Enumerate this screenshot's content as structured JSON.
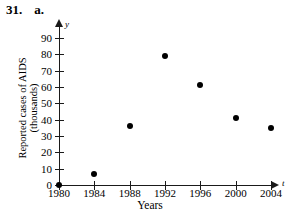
{
  "header": {
    "number": "31.",
    "part": "a."
  },
  "chart_data": {
    "type": "scatter",
    "title": "",
    "xlabel": "Years",
    "ylabel_lines": [
      "Reported cases of AIDS",
      "(thousands)"
    ],
    "ylabel": "Reported cases of AIDS (thousands)",
    "x_axis_variable": "t",
    "y_axis_variable": "y",
    "grid": false,
    "legend": "none",
    "xlim": [
      1980,
      2004
    ],
    "ylim": [
      0,
      90
    ],
    "x_ticks": [
      1980,
      1984,
      1988,
      1992,
      1996,
      2000,
      2004
    ],
    "x_tick_labels": [
      "1980",
      "1984",
      "1988",
      "1992",
      "1996",
      "2000",
      "2004"
    ],
    "y_ticks": [
      0,
      10,
      20,
      30,
      40,
      50,
      60,
      70,
      80,
      90
    ],
    "y_tick_labels": [
      "0",
      "10",
      "20",
      "30",
      "40",
      "50",
      "60",
      "70",
      "80",
      "90"
    ],
    "x": [
      1980,
      1984,
      1988,
      1992,
      1996,
      2000,
      2004
    ],
    "values": [
      0,
      7,
      36,
      79,
      61,
      41,
      35
    ],
    "points": [
      {
        "x": 1980,
        "y": 0
      },
      {
        "x": 1984,
        "y": 7
      },
      {
        "x": 1988,
        "y": 36
      },
      {
        "x": 1992,
        "y": 79
      },
      {
        "x": 1996,
        "y": 61
      },
      {
        "x": 2000,
        "y": 41
      },
      {
        "x": 2004,
        "y": 35
      }
    ],
    "marker": "filled-circle",
    "marker_color": "#000000",
    "axis_color": "#1a1a1a",
    "background_color": "#ffffff"
  }
}
